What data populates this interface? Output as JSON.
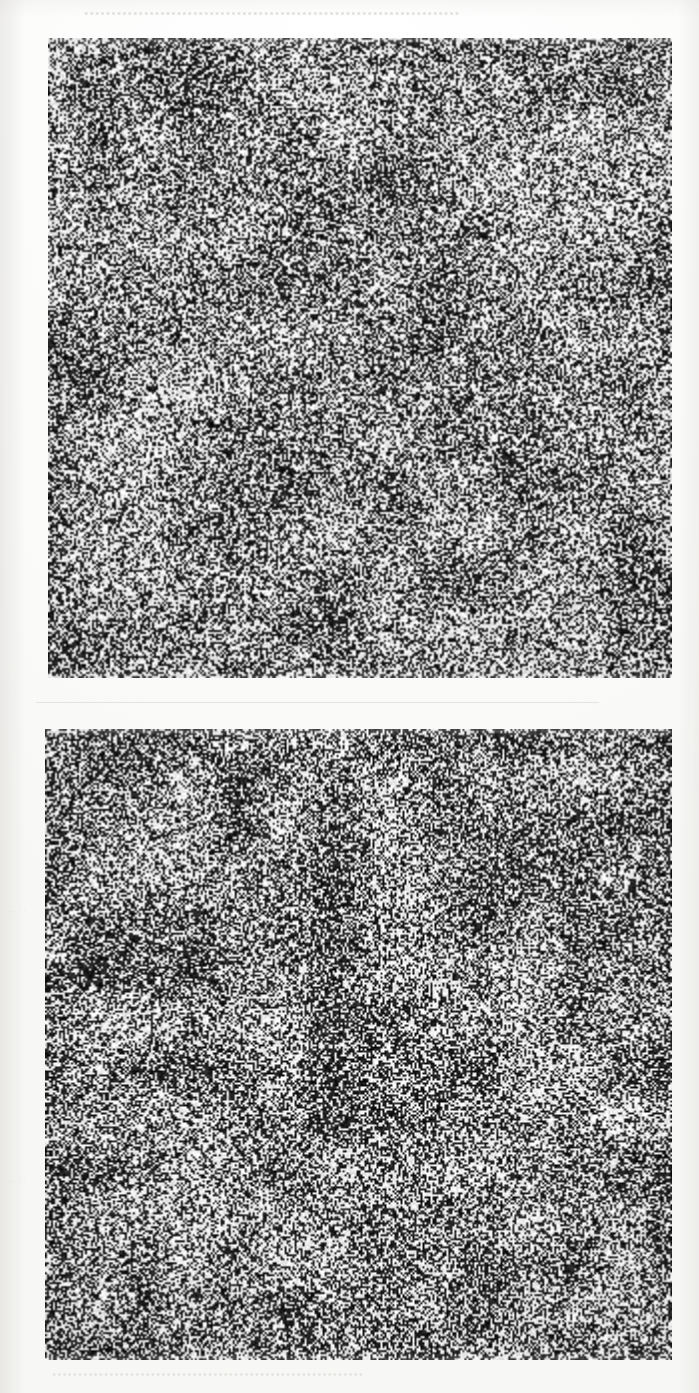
{
  "page": {
    "kind": "scanned-figure-plate",
    "width": 699,
    "height": 1393,
    "background_color": "#fdfdfc",
    "ink_color": "#1a1a1a",
    "paper_color": "#f2f1ee"
  },
  "figure": {
    "caption": "",
    "panel_count": 2,
    "panels": [
      {
        "id": "panel-top",
        "label": "",
        "kind": "random-dot-stereogram",
        "x": 48,
        "y": 38,
        "width": 624,
        "height": 640,
        "dot_density_percent": 50,
        "dot_cell_px": 2,
        "mean_gray": "#8a8a8a",
        "contrast": "high-binary"
      },
      {
        "id": "panel-bottom",
        "label": "",
        "kind": "random-dot-stereogram",
        "x": 45,
        "y": 729,
        "width": 627,
        "height": 631,
        "dot_density_percent": 52,
        "dot_cell_px": 2,
        "mean_gray": "#868686",
        "contrast": "high-binary"
      }
    ]
  },
  "ghost_text": {
    "note": "faint bleed-through from the reverse side of the page; not legible",
    "top_line": "•••••••••••••••••••••••••••••••••••••••••••••••••••••••••••••••••••••",
    "middle_line": "———————————————————————————————————",
    "bottom_line": "••••••••••••••••••••••••••••••••••••••••••••••••••••••••••••",
    "margin_line_a": "····",
    "margin_line_b": "····"
  }
}
